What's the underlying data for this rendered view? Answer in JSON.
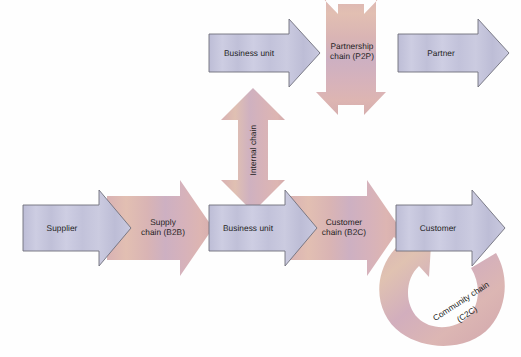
{
  "diagram": {
    "type": "process-flow-diagram",
    "palette": {
      "arrow_blue_fill": "#c7c7dd",
      "arrow_blue_fill_edge": "#b4b4cf",
      "arrow_blue_stroke": "#6f6f7c",
      "arrow_pink_fill": "#dcb2b2",
      "arrow_pink_fill_center": "#d3b0bd",
      "arrow_pink_fill_warm": "#e0c3ae",
      "text_color": "#1d1d22",
      "background": "#fefefe"
    },
    "nodes": [
      {
        "id": "business-unit-top",
        "label": "Business unit",
        "shape": "block-arrow-right",
        "style": "blue",
        "row": "top"
      },
      {
        "id": "partnership-chain",
        "label": "Partnership\nchain (P2P)",
        "label_line1": "Partnership",
        "label_line2": "chain (P2P)",
        "shape": "double-head-arrow-horizontal",
        "style": "pink",
        "row": "top"
      },
      {
        "id": "partner",
        "label": "Partner",
        "shape": "block-arrow-right",
        "style": "blue",
        "row": "top"
      },
      {
        "id": "internal-chain",
        "label": "Internal chain",
        "shape": "double-head-arrow-vertical",
        "style": "pink",
        "row": "middle",
        "rotation_deg": -90
      },
      {
        "id": "supplier",
        "label": "Supplier",
        "shape": "block-arrow-right",
        "style": "blue",
        "row": "bottom"
      },
      {
        "id": "supply-chain",
        "label": "Supply\nchain (B2B)",
        "label_line1": "Supply",
        "label_line2": "chain (B2B)",
        "shape": "block-arrow-right",
        "style": "pink",
        "row": "bottom"
      },
      {
        "id": "business-unit-bottom",
        "label": "Business unit",
        "shape": "block-arrow-right",
        "style": "blue",
        "row": "bottom"
      },
      {
        "id": "customer-chain",
        "label": "Customer\nchain (B2C)",
        "label_line1": "Customer",
        "label_line2": "chain (B2C)",
        "shape": "block-arrow-right",
        "style": "pink",
        "row": "bottom"
      },
      {
        "id": "customer",
        "label": "Customer",
        "shape": "block-arrow-right",
        "style": "blue",
        "row": "bottom"
      },
      {
        "id": "community-chain",
        "label": "Community chain\n(C2C)",
        "label_line1": "Community chain",
        "label_line2": "(C2C)",
        "shape": "curved-loop-arrow",
        "style": "pink",
        "row": "bottom",
        "rotation_deg": -33
      }
    ],
    "flow_order_top": [
      "business-unit-top",
      "partnership-chain",
      "partner"
    ],
    "flow_order_bottom": [
      "supplier",
      "supply-chain",
      "business-unit-bottom",
      "customer-chain",
      "customer"
    ],
    "vertical_link": "internal-chain",
    "feedback_loop": "community-chain"
  }
}
